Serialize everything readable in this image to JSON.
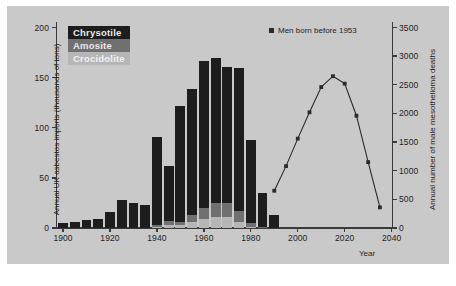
{
  "figure": {
    "background": "#c9c9c9",
    "caption": ""
  },
  "legend_bars": {
    "items": [
      {
        "label": "Chrysotile",
        "color": "#1d1d1d"
      },
      {
        "label": "Amosite",
        "color": "#707070"
      },
      {
        "label": "Crocidolite",
        "color": "#b6b6b6"
      }
    ]
  },
  "legend_line": {
    "marker": "square-marker",
    "label": "Men born before 1953",
    "color": "#2a2a2a"
  },
  "chart_data": {
    "type": "bar",
    "title": "",
    "subtitle": "",
    "xlabel": "Year",
    "xlim": [
      1897,
      2041
    ],
    "xticks": [
      1900,
      1920,
      1940,
      1960,
      1980,
      2000,
      2020,
      2040
    ],
    "xticklabels": [
      "1900",
      "1920",
      "1940",
      "1960",
      "1980",
      "2000",
      "2020",
      "2040"
    ],
    "grid": false,
    "legend_position": "upper-left",
    "left_axis": {
      "ylabel": "Annual UK asbestos imports (thousands of tons)",
      "ylim": [
        0,
        200
      ],
      "yticks": [
        0,
        50,
        100,
        150,
        200
      ],
      "yticklabels": [
        "0",
        "50",
        "100",
        "150",
        "200"
      ]
    },
    "right_axis": {
      "ylabel": "Annual number of male mesothelioma deaths",
      "ylim": [
        0,
        3500
      ],
      "yticks": [
        0,
        500,
        1000,
        1500,
        2000,
        2500,
        3000,
        3500
      ],
      "yticklabels": [
        "0",
        "500",
        "1000",
        "1500",
        "2000",
        "2500",
        "3000",
        "3500"
      ]
    },
    "stacked": true,
    "bar_width_years": 4.2,
    "categories": [
      1900,
      1905,
      1910,
      1915,
      1920,
      1925,
      1930,
      1935,
      1940,
      1945,
      1950,
      1955,
      1960,
      1965,
      1970,
      1975,
      1980,
      1985,
      1990
    ],
    "series": [
      {
        "name": "Crocidolite",
        "color": "#b6b6b6",
        "axis": "left",
        "values": [
          0,
          0,
          0,
          0,
          0,
          0,
          0,
          0,
          1,
          3,
          3,
          6,
          9,
          11,
          11,
          6,
          1,
          0,
          0
        ]
      },
      {
        "name": "Amosite",
        "color": "#707070",
        "axis": "left",
        "values": [
          0,
          0,
          0,
          0,
          0,
          0,
          0,
          0,
          2,
          4,
          3,
          7,
          11,
          14,
          14,
          11,
          4,
          1,
          0
        ]
      },
      {
        "name": "Chrysotile",
        "color": "#1d1d1d",
        "axis": "left",
        "values": [
          5,
          6,
          8,
          9,
          16,
          28,
          25,
          23,
          88,
          55,
          116,
          126,
          147,
          145,
          136,
          143,
          83,
          34,
          13
        ]
      }
    ],
    "totals": [
      5,
      6,
      8,
      9,
      16,
      28,
      25,
      23,
      91,
      62,
      122,
      139,
      167,
      170,
      161,
      160,
      88,
      35,
      13
    ],
    "line_series": {
      "name": "Men born before 1953",
      "color": "#2a2a2a",
      "axis": "right",
      "marker": "square",
      "x": [
        1990,
        1995,
        2000,
        2005,
        2010,
        2015,
        2020,
        2025,
        2030,
        2035
      ],
      "values": [
        650,
        1080,
        1560,
        2020,
        2460,
        2650,
        2520,
        1960,
        1150,
        360
      ]
    }
  }
}
